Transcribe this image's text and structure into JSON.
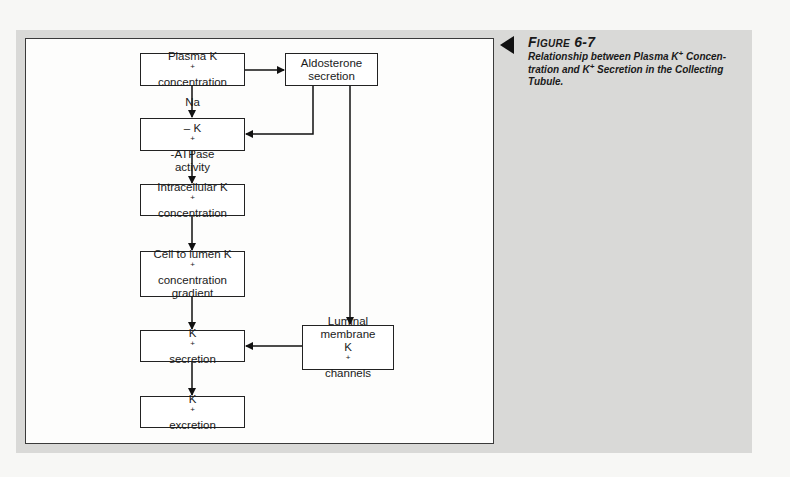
{
  "figure": {
    "label": "Figure 6-7",
    "caption_part1": "Relationship between Plasma K",
    "caption_sup1": "+",
    "caption_part2": " Concen-tration and K",
    "caption_sup2": "+",
    "caption_part3": " Secretion in the Collecting Tubule."
  },
  "nodes": {
    "plasma": {
      "line1": "Plasma K",
      "sup": "+",
      "line2": "concentration"
    },
    "aldosterone": {
      "line1": "Aldosterone",
      "line2": "secretion"
    },
    "atpase": {
      "pre": "Na",
      "sup1": "+",
      "mid": "– K",
      "sup2": "+",
      "post": "-ATPase",
      "line2": "activity"
    },
    "intracellular": {
      "line1": "Intracellular K",
      "sup": "+",
      "line2": "concentration"
    },
    "gradient": {
      "line1": "Cell to lumen K",
      "sup": "+",
      "line2": "concentration",
      "line3": "gradient"
    },
    "secretion": {
      "pre": "K",
      "sup": "+",
      "post": " secretion"
    },
    "luminal": {
      "line1": "Luminal",
      "line2": "membrane",
      "pre": "K",
      "sup": "+",
      "post": " channels"
    },
    "excretion": {
      "pre": "K",
      "sup": "+",
      "post": " excretion"
    }
  },
  "edges": [
    {
      "from": "plasma",
      "to": "aldosterone"
    },
    {
      "from": "plasma",
      "to": "atpase"
    },
    {
      "from": "aldosterone",
      "to": "atpase"
    },
    {
      "from": "aldosterone",
      "to": "luminal"
    },
    {
      "from": "atpase",
      "to": "intracellular"
    },
    {
      "from": "intracellular",
      "to": "gradient"
    },
    {
      "from": "gradient",
      "to": "secretion"
    },
    {
      "from": "luminal",
      "to": "secretion"
    },
    {
      "from": "secretion",
      "to": "excretion"
    }
  ],
  "colors": {
    "panel": "#d9d9d7",
    "frame": "#fdfdfc",
    "ink": "#1a1a1a"
  }
}
